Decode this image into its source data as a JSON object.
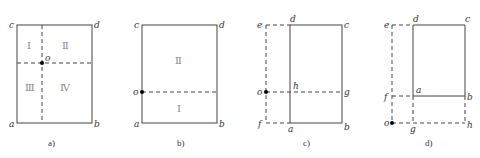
{
  "panels": [
    {
      "caption": "a)",
      "labels": {
        "c": "c",
        "d": "d",
        "a": "a",
        "b": "b",
        "o": "o"
      },
      "regions": [
        "Ⅰ",
        "Ⅱ",
        "Ⅲ",
        "Ⅳ"
      ]
    },
    {
      "caption": "b)",
      "labels": {
        "c": "c",
        "d": "d",
        "a": "a",
        "b": "b",
        "o": "o"
      },
      "regions": [
        "Ⅱ",
        "Ⅰ"
      ]
    },
    {
      "caption": "c)",
      "labels": {
        "e": "e",
        "d": "d",
        "c": "c",
        "o": "o",
        "h": "h",
        "g": "g",
        "f": "f",
        "a": "a",
        "b": "b"
      }
    },
    {
      "caption": "d)",
      "labels": {
        "e": "e",
        "d": "d",
        "c": "c",
        "f": "f",
        "a": "a",
        "b": "b",
        "o": "o",
        "g": "g",
        "h": "h"
      }
    }
  ]
}
